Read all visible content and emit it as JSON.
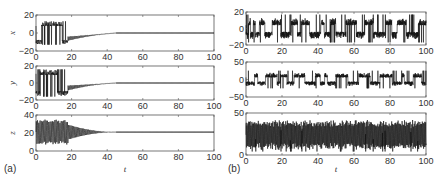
{
  "chart_data": [
    {
      "type": "line",
      "panel_label": "(a)",
      "title": "",
      "xlabel": "t",
      "description": "Chaotic oscillation until t≈18, then damped decay to a fixed point",
      "subplots": [
        {
          "ylabel": "x",
          "xlim": [
            0,
            100
          ],
          "ylim": [
            -20,
            20
          ],
          "yticks": [
            -20,
            0,
            20
          ],
          "xticks": [
            0,
            20,
            40,
            60,
            80,
            100
          ],
          "chaos_end": 18,
          "decay_end": 45,
          "amp": 13,
          "center": 0,
          "steady": 0
        },
        {
          "ylabel": "y",
          "xlim": [
            0,
            100
          ],
          "ylim": [
            -20,
            20
          ],
          "yticks": [
            -20,
            0,
            20
          ],
          "xticks": [
            0,
            20,
            40,
            60,
            80,
            100
          ],
          "chaos_end": 18,
          "decay_end": 45,
          "amp": 16,
          "center": 0,
          "steady": 0
        },
        {
          "ylabel": "z",
          "xlim": [
            0,
            100
          ],
          "ylim": [
            0,
            40
          ],
          "yticks": [
            0,
            20,
            40
          ],
          "xticks": [
            0,
            20,
            40,
            60,
            80,
            100
          ],
          "chaos_end": 18,
          "decay_end": 45,
          "amp": 14,
          "center": 21,
          "steady": 21
        }
      ]
    },
    {
      "type": "line",
      "panel_label": "(b)",
      "title": "",
      "xlabel": "t",
      "description": "Sustained chaotic (Lorenz-like) oscillation over whole interval",
      "subplots": [
        {
          "ylabel": "",
          "xlim": [
            0,
            100
          ],
          "ylim": [
            -20,
            20
          ],
          "yticks": [
            -20,
            0,
            20
          ],
          "xticks": [
            0,
            20,
            40,
            60,
            80,
            100
          ],
          "amp": 16,
          "center": 0
        },
        {
          "ylabel": "",
          "xlim": [
            0,
            100
          ],
          "ylim": [
            -50,
            50
          ],
          "yticks": [
            -50,
            0,
            50
          ],
          "xticks": [
            0,
            20,
            40,
            60,
            80,
            100
          ],
          "amp": 24,
          "center": 0
        },
        {
          "ylabel": "",
          "xlim": [
            0,
            100
          ],
          "ylim": [
            0,
            50
          ],
          "yticks": [
            0,
            50
          ],
          "xticks": [
            0,
            20,
            40,
            60,
            80,
            100
          ],
          "amp": 18,
          "center": 24
        }
      ]
    }
  ],
  "labels": {
    "panel_a": "(a)",
    "panel_b": "(b)",
    "t_label": "t"
  }
}
